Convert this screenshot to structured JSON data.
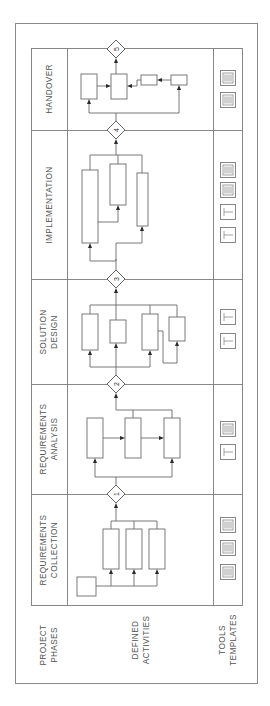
{
  "diagram": {
    "orientation": "rotated-90-ccw",
    "row_labels": {
      "phases_line1": "PROJECT",
      "phases_line2": "PHASES",
      "activities_line1": "DEFINED",
      "activities_line2": "ACTIVITIES",
      "tools_line1": "TOOLS",
      "tools_line2": "TEMPLATES"
    },
    "phases": [
      {
        "id": 1,
        "line1": "REQUIREMENTS",
        "line2": "COLLECTION",
        "gate": "1",
        "tools": [
          "template-icon",
          "template-icon",
          "template-icon"
        ]
      },
      {
        "id": 2,
        "line1": "REQUIREMENTS",
        "line2": "ANALYSIS",
        "gate": "2",
        "tools": [
          "tool-icon",
          "template-icon"
        ]
      },
      {
        "id": 3,
        "line1": "SOLUTION",
        "line2": "DESIGN",
        "gate": "3",
        "tools": [
          "tool-icon",
          "tool-icon"
        ]
      },
      {
        "id": 4,
        "line1": "IMPLEMENTATION",
        "line2": "",
        "gate": "4",
        "tools": [
          "tool-icon",
          "tool-icon",
          "template-icon",
          "template-icon"
        ]
      },
      {
        "id": 5,
        "line1": "HANDOVER",
        "line2": "",
        "gate": "5",
        "tools": [
          "template-icon",
          "template-icon"
        ]
      }
    ],
    "colors": {
      "line": "#6a6a6a",
      "text": "#555555",
      "arrow": "#2a2a2a",
      "background": "#ffffff"
    }
  }
}
